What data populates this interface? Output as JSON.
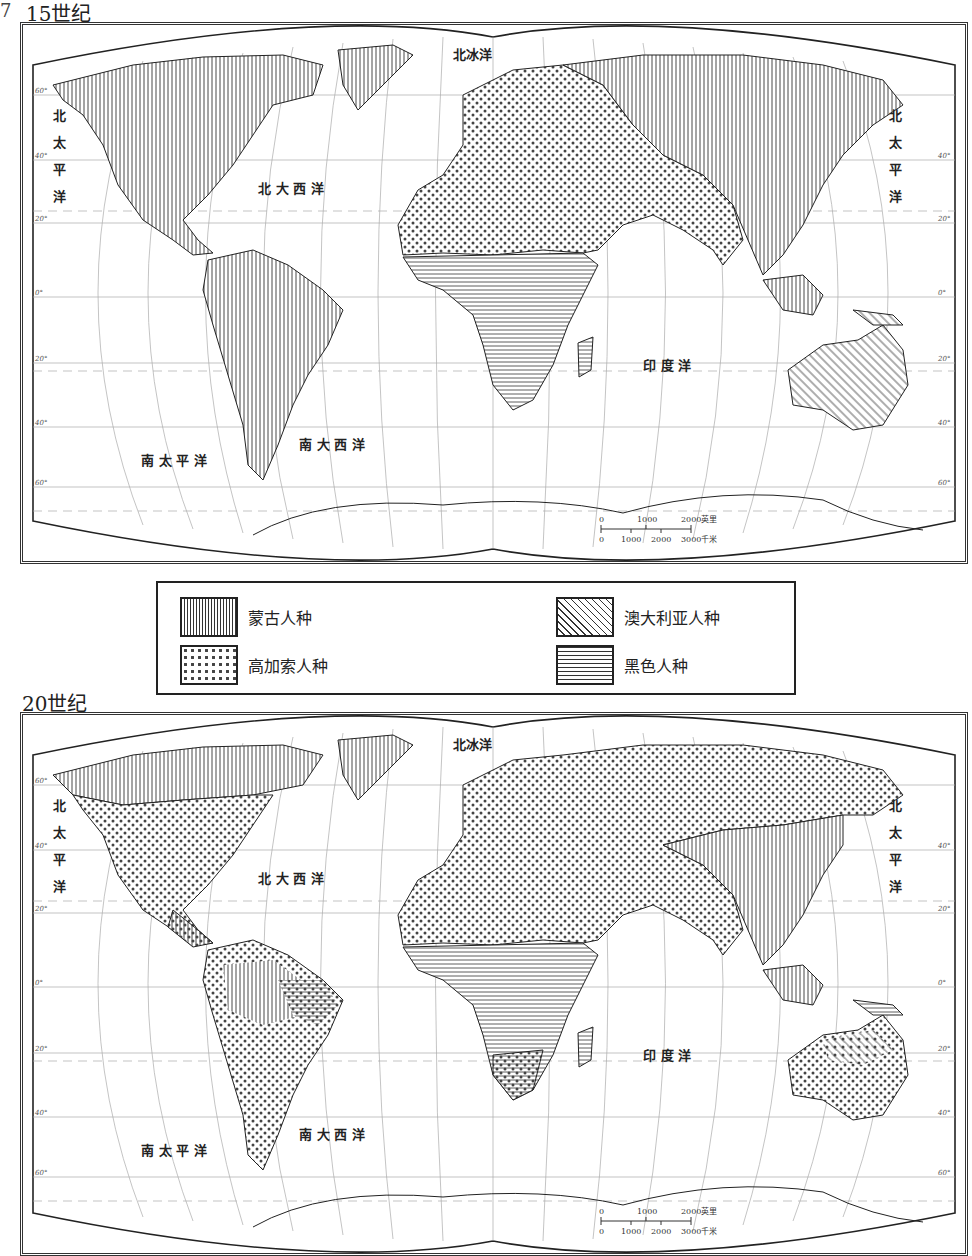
{
  "figure": {
    "question_marker": "7",
    "maps": [
      {
        "title": "15世纪",
        "oceans": {
          "arctic": "北冰洋",
          "north_pacific_left": [
            "北",
            "太",
            "平",
            "洋"
          ],
          "north_pacific_right": [
            "北",
            "太",
            "平",
            "洋"
          ],
          "north_atlantic": "北 大 西 洋",
          "south_pacific": "南 太 平 洋",
          "south_atlantic": "南 大 西 洋",
          "indian": "印 度 洋"
        },
        "scale": {
          "miles_ticks": [
            "0",
            "1000",
            "2000"
          ],
          "miles_unit": "英里",
          "km_ticks": [
            "0",
            "1000",
            "2000",
            "3000"
          ],
          "km_unit": "千米"
        }
      },
      {
        "title": "20世纪",
        "oceans": {
          "arctic": "北冰洋",
          "north_pacific_left": [
            "北",
            "太",
            "平",
            "洋"
          ],
          "north_pacific_right": [
            "北",
            "太",
            "平",
            "洋"
          ],
          "north_atlantic": "北 大 西 洋",
          "south_pacific": "南 太 平 洋",
          "south_atlantic": "南 大 西 洋",
          "indian": "印 度 洋"
        },
        "scale": {
          "miles_ticks": [
            "0",
            "1000",
            "2000"
          ],
          "miles_unit": "英里",
          "km_ticks": [
            "0",
            "1000",
            "2000",
            "3000"
          ],
          "km_unit": "千米"
        }
      }
    ],
    "latitude_labels": [
      "60°",
      "40°",
      "20°",
      "0°",
      "20°",
      "40°",
      "60°"
    ],
    "longitude_labels": [
      "80°",
      "100°",
      "140°",
      "120°",
      "100°",
      "40°",
      "0°",
      "20°",
      "40°",
      "60°",
      "80°",
      "100°",
      "120°",
      "140°",
      "160°"
    ],
    "legend": {
      "items": [
        {
          "key": "mongoloid",
          "label": "蒙古人种",
          "pattern": "vertical-lines"
        },
        {
          "key": "australoid",
          "label": "澳大利亚人种",
          "pattern": "diagonal-lines"
        },
        {
          "key": "caucasoid",
          "label": "高加索人种",
          "pattern": "dots"
        },
        {
          "key": "negroid",
          "label": "黑色人种",
          "pattern": "horizontal-lines"
        }
      ]
    }
  }
}
